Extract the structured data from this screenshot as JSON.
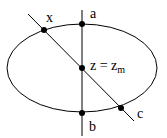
{
  "diagram": {
    "labels": {
      "x": "x",
      "a": "a",
      "b": "b",
      "c": "c",
      "center_main": "z = z",
      "center_sub": "m"
    },
    "shapes": {
      "ellipse": {
        "cx": 82,
        "cy": 68,
        "rx": 75,
        "ry": 44
      },
      "vertical_line": {
        "x1": 82,
        "y1": 10,
        "x2": 82,
        "y2": 136
      },
      "diagonal_line": {
        "x1": 28,
        "y1": 14,
        "x2": 134,
        "y2": 121
      }
    },
    "points": [
      {
        "name": "x",
        "x": 44,
        "y": 30
      },
      {
        "name": "a",
        "x": 82,
        "y": 24
      },
      {
        "name": "center",
        "x": 82,
        "y": 68
      },
      {
        "name": "b",
        "x": 82,
        "y": 113
      },
      {
        "name": "c",
        "x": 121,
        "y": 108
      }
    ],
    "colors": {
      "stroke": "#000000",
      "background": "#ffffff"
    }
  }
}
